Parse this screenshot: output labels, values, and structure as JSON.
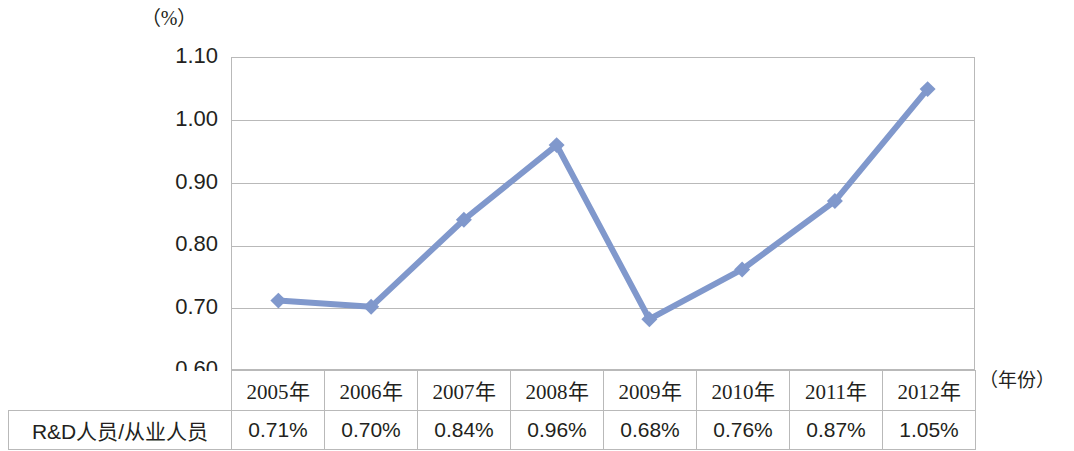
{
  "axis": {
    "unit_label": "（%）",
    "x_caption": "（年份）",
    "y_ticks": [
      "1.10",
      "1.00",
      "0.90",
      "0.80",
      "0.70",
      "0.60"
    ]
  },
  "table": {
    "row_label": "R&D人员/从业人员",
    "years": [
      "2005年",
      "2006年",
      "2007年",
      "2008年",
      "2009年",
      "2010年",
      "2011年",
      "2012年"
    ],
    "values": [
      "0.71%",
      "0.70%",
      "0.84%",
      "0.96%",
      "0.68%",
      "0.76%",
      "0.87%",
      "1.05%"
    ]
  },
  "style": {
    "line_color": "#8098cc",
    "marker_color": "#8098cc",
    "grid_color": "#b9b9b9"
  },
  "chart_data": {
    "type": "line",
    "title": "",
    "subtitle": "",
    "xlabel": "（年份）",
    "ylabel": "（%）",
    "categories": [
      "2005年",
      "2006年",
      "2007年",
      "2008年",
      "2009年",
      "2010年",
      "2011年",
      "2012년"
    ],
    "x": [
      2005,
      2006,
      2007,
      2008,
      2009,
      2010,
      2011,
      2012
    ],
    "series": [
      {
        "name": "R&D人员/从业人员",
        "values": [
          0.71,
          0.7,
          0.84,
          0.96,
          0.68,
          0.76,
          0.87,
          1.05
        ],
        "labels": [
          "0.71%",
          "0.70%",
          "0.84%",
          "0.96%",
          "0.68%",
          "0.76%",
          "0.87%",
          "1.05%"
        ],
        "color": "#8098cc",
        "marker": "diamond"
      }
    ],
    "ylim": [
      0.6,
      1.1
    ],
    "ytick_values": [
      0.6,
      0.7,
      0.8,
      0.9,
      1.0,
      1.1
    ],
    "ytick_labels": [
      "0.60",
      "0.70",
      "0.80",
      "0.90",
      "1.00",
      "1.10"
    ],
    "grid": true,
    "grid_axis": "y",
    "legend": false,
    "legend_position": "none",
    "data_table_below": true
  }
}
